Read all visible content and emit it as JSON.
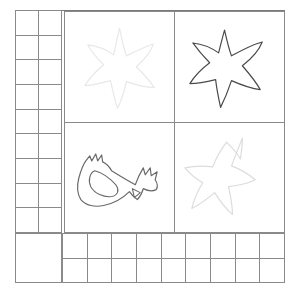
{
  "worksheet": {
    "background_color": "#ffffff",
    "frame": {
      "border_color": "#7a7a7a",
      "grid_line_color": "#8a8a8a"
    },
    "left_tally_strip": {
      "name": "left-tally-strip",
      "columns": 2,
      "rows": 9,
      "cells_empty": true,
      "footer_cell_empty": true
    },
    "bottom_tally_strip": {
      "name": "bottom-tally-strip",
      "columns": 9,
      "rows": 2,
      "cells_empty": true
    },
    "picture_panel": {
      "name": "picture-panel",
      "columns": 2,
      "rows": 2,
      "quadrants": [
        {
          "position": "top-left",
          "shape": "star",
          "shape_label": "starfish-outline",
          "stroke_color": "#e8e8e8",
          "stroke_width": 1.2
        },
        {
          "position": "top-right",
          "shape": "star",
          "shape_label": "starfish-outline",
          "stroke_color": "#4a4a4a",
          "stroke_width": 1.2
        },
        {
          "position": "bottom-left",
          "shape": "bird",
          "shape_label": "rooster-outline",
          "stroke_color": "#6a6a6a",
          "stroke_width": 1.2
        },
        {
          "position": "bottom-right",
          "shape": "star",
          "shape_label": "starfish-outline",
          "stroke_color": "#dcdcdc",
          "stroke_width": 1.2
        }
      ]
    }
  }
}
